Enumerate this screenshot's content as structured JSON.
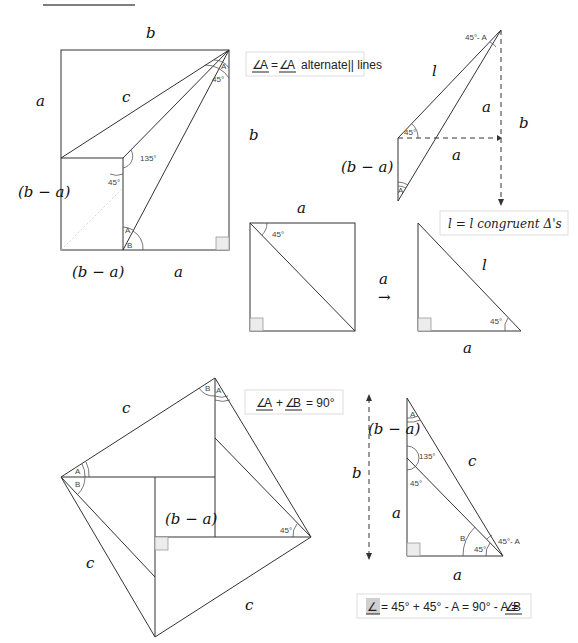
{
  "labels": {
    "b": "b",
    "a": "a",
    "c": "c",
    "l": "l",
    "b_minus_a": "(b − a)",
    "arrow": "→"
  },
  "angles": {
    "deg45": "45°",
    "deg135": "135°",
    "deg45_minus_A": "45°- A",
    "A": "A",
    "B": "B"
  },
  "notes": {
    "alternate": {
      "angle1": "A",
      "eq": "=",
      "angle2": "A",
      "text": "alternate|| lines"
    },
    "congruent": "l = l congruent Δ's",
    "sum90": {
      "angle1": "A",
      "plus": "+",
      "angle2": "B",
      "text": "= 90°"
    },
    "final": {
      "text": "= 45° + 45° - A = 90° - A =",
      "angle": "B"
    }
  }
}
